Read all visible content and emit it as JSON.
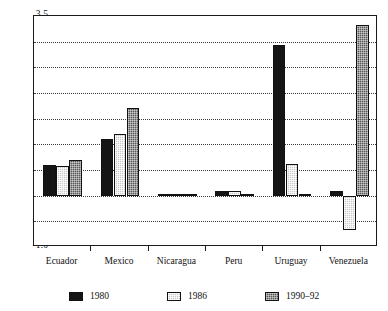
{
  "chart_data": {
    "type": "bar",
    "title": "",
    "xlabel": "",
    "ylabel": "",
    "ylim": [
      -1.0,
      3.5
    ],
    "ytick_labels": [
      "3.5",
      "3.0",
      "2.5",
      "2.0",
      "1.5",
      "1.0",
      "0.5",
      "0.0",
      "-0.5",
      "-1.0"
    ],
    "ytick_values": [
      3.5,
      3.0,
      2.5,
      2.0,
      1.5,
      1.0,
      0.5,
      0.0,
      -0.5,
      -1.0
    ],
    "grid": true,
    "legend_position": "bottom",
    "categories": [
      "Ecuador",
      "Mexico",
      "Nicaragua",
      "Peru",
      "Uruguay",
      "Venezuela"
    ],
    "series": [
      {
        "name": "1980",
        "color": "#151515",
        "values": [
          0.6,
          1.1,
          0.0,
          0.1,
          2.93,
          0.1
        ]
      },
      {
        "name": "1986",
        "color": "#c9c9c9",
        "values": [
          0.58,
          1.2,
          0.0,
          0.1,
          0.62,
          -0.67
        ]
      },
      {
        "name": "1990-92",
        "color": "#565656",
        "values": [
          0.7,
          1.7,
          0.0,
          0.0,
          0.0,
          3.32
        ]
      }
    ]
  },
  "legend": {
    "items": [
      {
        "label": "1980"
      },
      {
        "label": "1986"
      },
      {
        "label": "1990–92"
      }
    ]
  }
}
